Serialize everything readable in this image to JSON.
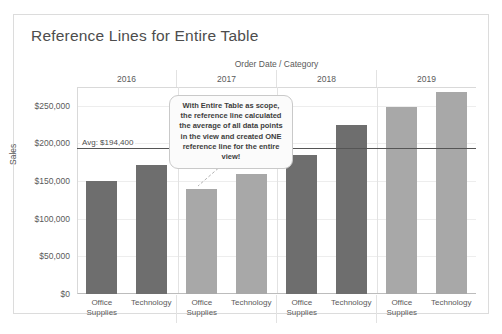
{
  "card": {
    "title": "Reference Lines for Entire Table"
  },
  "chart_data": {
    "type": "bar",
    "title": "Reference Lines for Entire Table",
    "xlabel": "Order Date / Category",
    "ylabel": "Sales",
    "ylim": [
      0,
      275000
    ],
    "grid": true,
    "legend": "none",
    "y_ticks": [
      "$0",
      "$50,000",
      "$100,000",
      "$150,000",
      "$200,000",
      "$250,000"
    ],
    "y_tick_values": [
      0,
      50000,
      100000,
      150000,
      200000,
      250000
    ],
    "group_labels": [
      "2016",
      "2017",
      "2018",
      "2019"
    ],
    "categories": [
      "Office Supplies",
      "Technology"
    ],
    "bars": [
      {
        "group": "2016",
        "category": "Office Supplies",
        "value": 150000,
        "shade": "dark"
      },
      {
        "group": "2016",
        "category": "Technology",
        "value": 172000,
        "shade": "dark"
      },
      {
        "group": "2017",
        "category": "Office Supplies",
        "value": 139000,
        "shade": "light"
      },
      {
        "group": "2017",
        "category": "Technology",
        "value": 159000,
        "shade": "light"
      },
      {
        "group": "2018",
        "category": "Office Supplies",
        "value": 185000,
        "shade": "dark"
      },
      {
        "group": "2018",
        "category": "Technology",
        "value": 224000,
        "shade": "dark"
      },
      {
        "group": "2019",
        "category": "Office Supplies",
        "value": 248000,
        "shade": "light"
      },
      {
        "group": "2019",
        "category": "Technology",
        "value": 268000,
        "shade": "light"
      }
    ],
    "reference_line": {
      "label": "Avg: $194,400",
      "value": 194400,
      "scope": "Entire Table"
    },
    "colors": {
      "bar_dark": "#6e6e6e",
      "bar_light": "#a8a8a8",
      "reference_line": "#555555",
      "gridline": "#ededed"
    }
  },
  "callout": {
    "text": "With Entire Table as scope, the reference line calculated the average of all data points in the view and created ONE reference line for the entire view!"
  }
}
